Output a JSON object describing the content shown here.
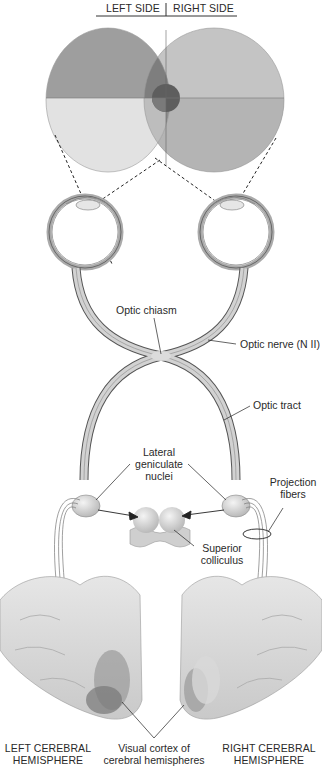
{
  "header": {
    "left_side": "LEFT SIDE",
    "right_side": "RIGHT SIDE"
  },
  "labels": {
    "optic_chiasm": "Optic chiasm",
    "optic_nerve": "Optic nerve (N II)",
    "optic_tract": "Optic tract",
    "lateral_geniculate_line1": "Lateral",
    "lateral_geniculate_line2": "geniculate",
    "lateral_geniculate_line3": "nuclei",
    "projection_fibers_line1": "Projection",
    "projection_fibers_line2": "fibers",
    "superior_colliculus_line1": "Superior",
    "superior_colliculus_line2": "colliculus",
    "left_hemisphere_line1": "LEFT CEREBRAL",
    "left_hemisphere_line2": "HEMISPHERE",
    "visual_cortex_line1": "Visual cortex of",
    "visual_cortex_line2": "cerebral hemispheres",
    "right_hemisphere_line1": "RIGHT CEREBRAL",
    "right_hemisphere_line2": "HEMISPHERE"
  },
  "colors": {
    "field_upper_left": "#9e9e9e",
    "field_lower_left": "#e0e0e0",
    "field_overlap_upper": "#7d7d7d",
    "field_overlap_lower_left": "#c0c0c0",
    "field_overlap_lower_right": "#8a8a8a",
    "field_right": "#c4c4c4",
    "fovea": "#5e5e5e",
    "nerve": "#c8c8c8",
    "outline": "#555555"
  }
}
